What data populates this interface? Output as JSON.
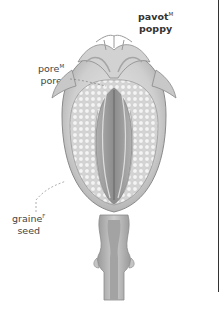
{
  "title": {
    "fr": "pavot",
    "fr_gender": "M",
    "en": "poppy"
  },
  "labels": [
    {
      "id": "pore",
      "fr": "pore",
      "fr_gender": "M",
      "en": "pore"
    },
    {
      "id": "seed",
      "fr": "graine",
      "fr_gender": "F",
      "en": "seed"
    }
  ],
  "colors": {
    "outline": "#8a8a8a",
    "capsule_light": "#d9d9d9",
    "capsule_mid": "#b9b9b9",
    "capsule_dark": "#8f8f8f",
    "seed": "#f2f2f2",
    "text": "#333333"
  }
}
